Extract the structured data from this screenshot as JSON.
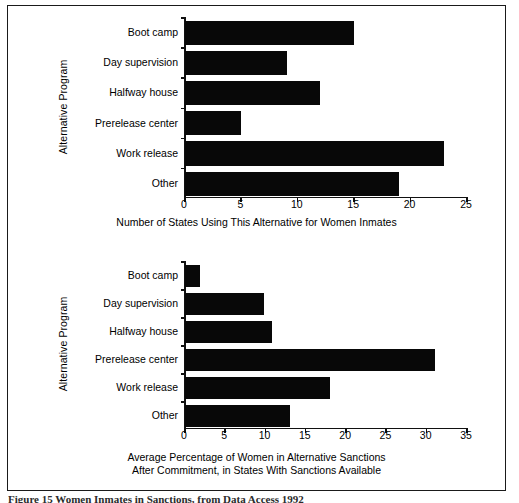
{
  "figure": {
    "caption": "Figure 15  Women Inmates in Sanctions, from Data Access 1992",
    "frame_color": "#1a1a1a",
    "bar_color": "#080808",
    "background": "#ffffff"
  },
  "chart_data": [
    {
      "id": "top",
      "type": "bar",
      "orientation": "horizontal",
      "title": "",
      "xlabel": "Number of States Using This Alternative for Women Inmates",
      "ylabel": "Alternative Program",
      "categories": [
        "Boot camp",
        "Day supervision",
        "Halfway house",
        "Prerelease center",
        "Work release",
        "Other"
      ],
      "values": [
        15,
        9,
        12,
        5,
        23,
        19
      ],
      "xlim": [
        0,
        25
      ],
      "xticks": [
        0,
        5,
        10,
        15,
        20,
        25
      ],
      "xtick_labels": [
        "0",
        "5",
        "10",
        "15",
        "20",
        "25"
      ],
      "grid": false,
      "legend": null
    },
    {
      "id": "bottom",
      "type": "bar",
      "orientation": "horizontal",
      "title": "",
      "xlabel": "Average Percentage of Women in Alternative Sanctions\nAfter Commitment, in States With Sanctions Available",
      "xlabel_line1": "Average Percentage of Women in Alternative Sanctions",
      "xlabel_line2": "After Commitment, in States With Sanctions Available",
      "ylabel": "Alternative Program",
      "categories": [
        "Boot camp",
        "Day supervision",
        "Halfway house",
        "Prerelease center",
        "Work release",
        "Other"
      ],
      "values": [
        1.8,
        9.8,
        10.8,
        31,
        18,
        13
      ],
      "xlim": [
        0,
        35
      ],
      "xticks": [
        0,
        5,
        10,
        15,
        20,
        25,
        30,
        35
      ],
      "xtick_labels": [
        "0",
        "5",
        "10",
        "15",
        "20",
        "25",
        "30",
        "35"
      ],
      "grid": false,
      "legend": null
    }
  ]
}
